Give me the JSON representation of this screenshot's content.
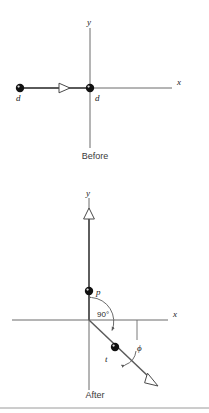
{
  "figure": {
    "caption_before": "Before",
    "caption_after": "After",
    "axis_x_label": "x",
    "axis_y_label": "y",
    "colors": {
      "line": "#6b6b6b",
      "ball": "#111111",
      "text": "#2a2a2a",
      "arrow_fill": "#ffffff",
      "rule": "#9a9a9a"
    }
  },
  "before": {
    "name": "Before",
    "axes": {
      "x_label": "x",
      "y_label": "y",
      "origin": {
        "x": 90,
        "y": 88
      },
      "x_start": 20,
      "x_end": 172,
      "y_top": 28,
      "y_bottom": 148
    },
    "balls": [
      {
        "id": "incoming-ball",
        "label": "d",
        "x": 20,
        "y": 88,
        "label_x": 19,
        "label_y": 100
      },
      {
        "id": "target-ball",
        "label": "d",
        "x": 90,
        "y": 88,
        "label_x": 96,
        "label_y": 100
      }
    ],
    "velocity_arrow": {
      "id": "incoming-velocity-arrow",
      "direction": "right",
      "tip_x": 70,
      "y": 88
    },
    "caption": "Before"
  },
  "after": {
    "name": "After",
    "axes": {
      "x_label": "x",
      "y_label": "y",
      "origin": {
        "x": 89,
        "y": 320
      },
      "x_start": 12,
      "x_end": 168,
      "y_top": 205,
      "y_bottom": 390
    },
    "balls": [
      {
        "id": "ball-p",
        "label": "p",
        "x": 89,
        "y": 291,
        "label_x": 97,
        "label_y": 292
      },
      {
        "id": "ball-t",
        "label": "t",
        "x": 115,
        "y": 347,
        "label_x": 107,
        "label_y": 360
      }
    ],
    "momentum_arrows": [
      {
        "id": "p-momentum-arrow",
        "direction": "up",
        "tip_x": 89,
        "tip_y": 208
      },
      {
        "id": "t-momentum-arrow",
        "direction": "down-right",
        "tip_x": 157,
        "tip_y": 385
      }
    ],
    "angles": [
      {
        "id": "angle-90",
        "label": "90°",
        "label_x": 101,
        "label_y": 314
      },
      {
        "id": "angle-phi",
        "label": "ϕ",
        "label_x": 140,
        "label_y": 348
      }
    ],
    "caption": "After"
  }
}
